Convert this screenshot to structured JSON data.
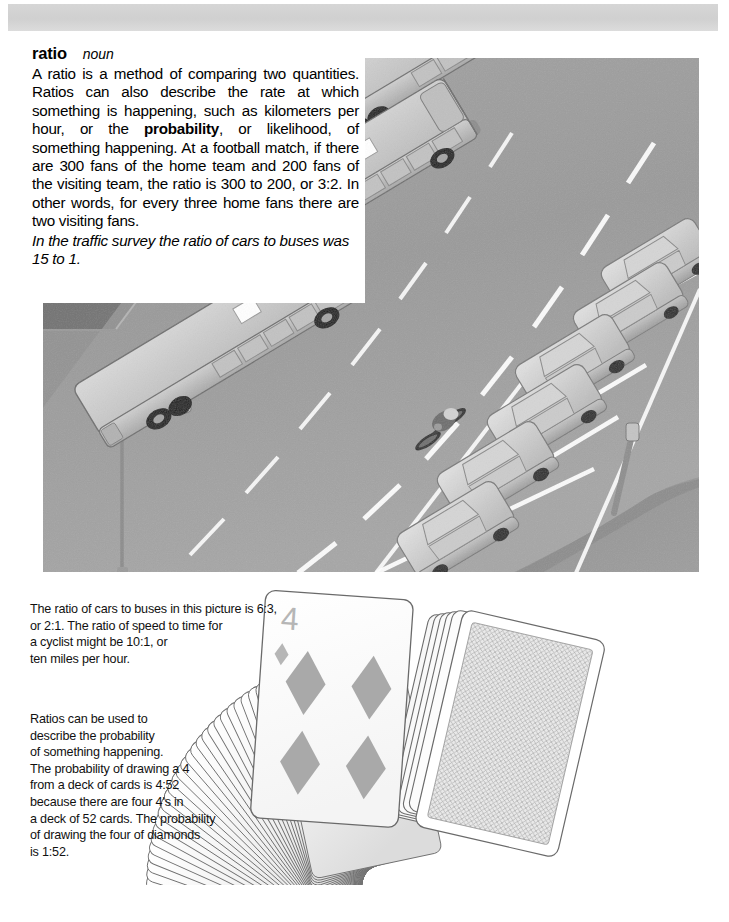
{
  "page": {
    "background_color": "#ffffff",
    "width": 729,
    "height": 922
  },
  "top_banner": {
    "name": "page-header-bar",
    "color": "#d4d4d4"
  },
  "definition": {
    "headword": "ratio",
    "part_of_speech": "noun",
    "body_segments": [
      {
        "text": "A ratio is a method of comparing two quantities. Ratios can also describe the rate at which something is happening, such as kilometers per hour, or the ",
        "bold": false
      },
      {
        "text": "probability",
        "bold": true
      },
      {
        "text": ", or likelihood, of something happening. At a football match, if there are 300 fans of the home team and 200 fans of the visiting team, the ratio is 300 to 200, or 3:2. In other words, for every three home fans there are two visiting fans.",
        "bold": false
      }
    ],
    "body_plain": "A ratio is a method of comparing two quantities. Ratios can also describe the rate at which something is happening, such as kilometers per hour, or the probability, or likelihood, of something happening. At a football match, if there are 300 fans of the home team and 200 fans of the visiting team, the ratio is 300 to 200, or 3:2. In other words, for every three home fans there are two visiting fans.",
    "example_sentence": "In the traffic survey the ratio of cars to buses was 15 to 1."
  },
  "illustration": {
    "name": "street-traffic-scene",
    "description": "Aerial grayscale illustration of a curving road with three buses in the near lane, a cyclist in the middle lane, and a row of angled parking bays filled with parked cars on the right, plus a street lamp on the sidewalk.",
    "buses": 3,
    "cars": 6,
    "cyclists": 1,
    "colors": {
      "road": "#9b9b9b",
      "sidewalk": "#6f6f6f",
      "grass": "#8d8d8d",
      "lane_marking": "#ffffff",
      "vehicle_body": "#c9c9c9",
      "vehicle_shadow": "#8a8a8a"
    }
  },
  "caption_traffic": {
    "name": "traffic-ratio-caption",
    "lines": [
      "The ratio of cars to buses in this picture is 6:3,",
      "or 2:1. The ratio of speed to time for",
      "a cyclist might be 10:1, or",
      "ten miles per hour."
    ]
  },
  "caption_cards": {
    "name": "probability-cards-caption",
    "lines": [
      "Ratios can be used to",
      "describe the probability",
      "of something happening.",
      "The probability of drawing a 4",
      "from a deck of cards is 4:52",
      "because there are four 4's in",
      "a deck of 52 cards. The probability",
      "of drawing the four of diamonds",
      "is 1:52."
    ]
  },
  "cards_illustration": {
    "name": "fanned-deck-of-cards",
    "fanned_card_count": 34,
    "face_up_card": {
      "rank": "4",
      "suit": "diamonds",
      "pip_count": 4,
      "corner_index": "4"
    },
    "face_down_cards": 5,
    "colors": {
      "card_face": "#fdfdfd",
      "card_edge": "#6e6e6e",
      "pip": "#a8a8a8",
      "card_back_pattern": "#b4b4b4"
    }
  }
}
